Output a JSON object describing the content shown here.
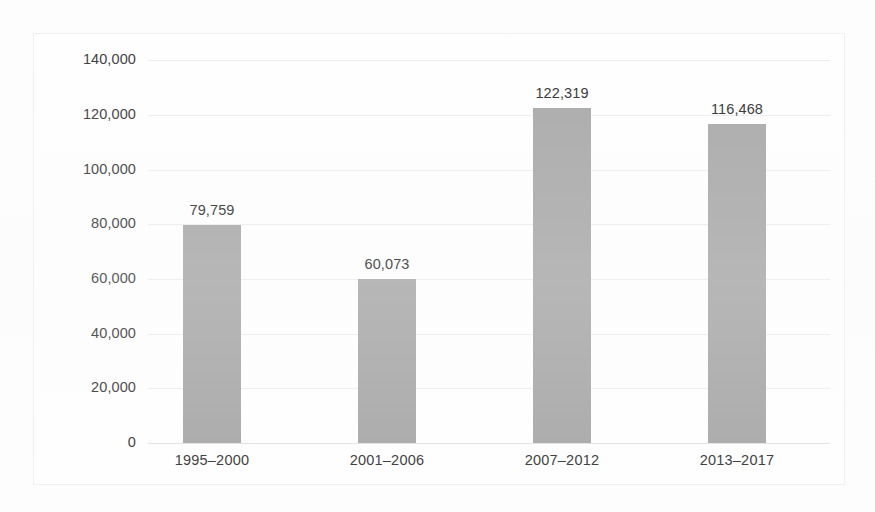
{
  "chart_data": {
    "type": "bar",
    "title": "",
    "subtitle": "",
    "xlabel": "",
    "ylabel": "",
    "categories": [
      "1995–2000",
      "2001–2006",
      "2007–2012",
      "2013–2017"
    ],
    "values": [
      79759,
      60073,
      122319,
      116468
    ],
    "value_labels": [
      "79,759",
      "60,073",
      "122,319",
      "116,468"
    ],
    "ylim": [
      0,
      140000
    ],
    "ytick_values": [
      0,
      20000,
      40000,
      60000,
      80000,
      100000,
      120000,
      140000
    ],
    "ytick_labels": [
      "0",
      "20,000",
      "40,000",
      "60,000",
      "80,000",
      "100,000",
      "120,000",
      "140,000"
    ],
    "grid": true,
    "legend": false,
    "legend_position": "none",
    "series": [
      {
        "name": "",
        "values": [
          79759,
          60073,
          122319,
          116468
        ]
      }
    ]
  },
  "style": {
    "bar_color": "#a9a9a9",
    "gridline_color": "#ededed",
    "axis_color": "#e2e2e2",
    "text_color": "#3a3a3a",
    "value_text_color": "#2f2f2f",
    "background": "#fdfdfd",
    "frame_border": "#f0f0f0"
  }
}
